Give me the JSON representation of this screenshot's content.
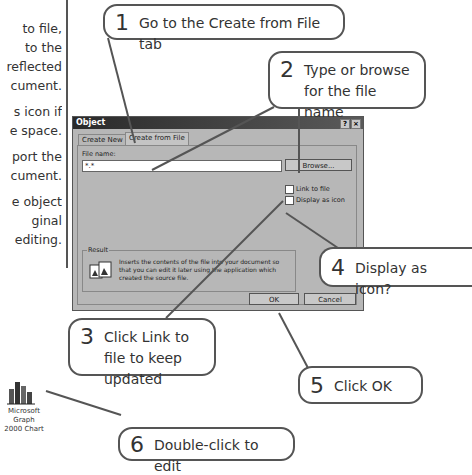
{
  "side_paragraphs": [
    {
      "lines": [
        "to file,",
        "to the",
        "reflected",
        "cument."
      ]
    },
    {
      "lines": [
        "s icon if",
        "e space."
      ]
    },
    {
      "lines": [
        "port the",
        "cument."
      ]
    },
    {
      "lines": [
        "e object",
        "ginal",
        "editing."
      ]
    }
  ],
  "callouts": [
    {
      "num": "1",
      "text": "Go to the Create from File tab"
    },
    {
      "num": "2",
      "text": "Type or browse for the file name"
    },
    {
      "num": "3",
      "text": "Click Link to file to keep updated"
    },
    {
      "num": "4",
      "text": "Display as icon?"
    },
    {
      "num": "5",
      "text": "Click OK"
    },
    {
      "num": "6",
      "text": "Double-click to edit"
    }
  ],
  "dialog": {
    "title": "Object",
    "help_btn": "?",
    "close_btn": "×",
    "tabs": [
      {
        "label": "Create New",
        "active": false
      },
      {
        "label": "Create from File",
        "active": true
      }
    ],
    "file_name_label": "File name:",
    "file_name_value": "*.*",
    "browse_label": "Browse...",
    "link_to_file_label": "Link to file",
    "link_to_file_checked": false,
    "display_as_icon_label": "Display as icon",
    "display_as_icon_checked": false,
    "result_label": "Result",
    "result_text": "Inserts the contents of the file into your document so that you can edit it later using the application which created the source file.",
    "ok_label": "OK",
    "cancel_label": "Cancel"
  },
  "desktop_icon": {
    "icon": "microsoft-graph-chart-icon",
    "label_line1": "Microsoft Graph",
    "label_line2": "2000 Chart"
  }
}
